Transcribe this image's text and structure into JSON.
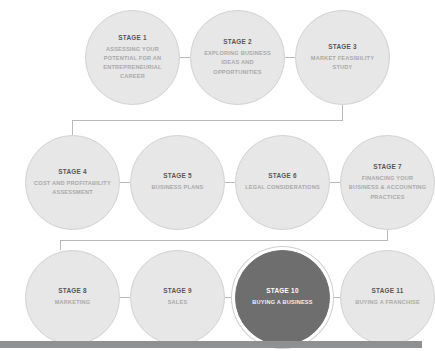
{
  "diagram": {
    "type": "flowchart",
    "orientation": "serpentine-rows",
    "colors": {
      "node_fill": "#e7e7e7",
      "node_border": "#d2d2d2",
      "stage_text": "#575757",
      "title_text": "#a9a9a9",
      "highlight_fill": "#6e6e6e",
      "highlight_stage_text": "#ffffff",
      "highlight_title_text": "#f2f2f2",
      "connector": "#b9b9b9",
      "bottom_band": "#8f9091",
      "background": "#ffffff"
    },
    "rows": [
      {
        "nodes": [
          {
            "stage": "STAGE 1",
            "title": "ASSESSING YOUR POTENTIAL FOR AN ENTREPRENEURIAL CAREER",
            "highlighted": false
          },
          {
            "stage": "STAGE 2",
            "title": "EXPLORING BUSINESS IDEAS AND OPPORTUNITIES",
            "highlighted": false
          },
          {
            "stage": "STAGE 3",
            "title": "MARKET FEASIBILITY STUDY",
            "highlighted": false
          }
        ]
      },
      {
        "nodes": [
          {
            "stage": "STAGE 4",
            "title": "COST AND PROFITABILITY ASSESSMENT",
            "highlighted": false
          },
          {
            "stage": "STAGE 5",
            "title": "BUSINESS PLANS",
            "highlighted": false
          },
          {
            "stage": "STAGE 6",
            "title": "LEGAL CONSIDERATIONS",
            "highlighted": false
          },
          {
            "stage": "STAGE 7",
            "title": "FINANCING YOUR BUSINESS & ACCOUNTING PRACTICES",
            "highlighted": false
          }
        ]
      },
      {
        "nodes": [
          {
            "stage": "STAGE 8",
            "title": "MARKETING",
            "highlighted": false
          },
          {
            "stage": "STAGE 9",
            "title": "SALES",
            "highlighted": false
          },
          {
            "stage": "STAGE 10",
            "title": "BUYING A BUSINESS",
            "highlighted": true
          },
          {
            "stage": "STAGE 11",
            "title": "BUYING A FRANCHISE",
            "highlighted": false
          }
        ]
      }
    ]
  }
}
